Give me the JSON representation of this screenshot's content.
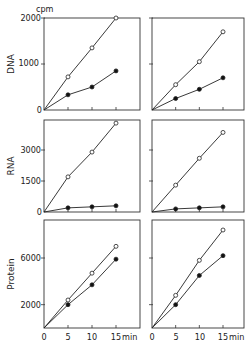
{
  "chart_data": {
    "type": "line",
    "layout": "3x2 panel grid",
    "unit_label": "cpm",
    "x": [
      0,
      5,
      10,
      15
    ],
    "xlabel": "min",
    "x_tick_labels": [
      "0",
      "5",
      "10",
      "15 min"
    ],
    "markers": {
      "open_circle": "series A (open circles)",
      "filled_circle": "series B (filled circles)"
    },
    "panels": [
      {
        "row": "DNA",
        "column": "left",
        "ylabel": "DNA",
        "yticks": [
          0,
          1000,
          2000
        ],
        "ylim": [
          0,
          2000
        ],
        "series": [
          {
            "name": "open",
            "values": [
              0,
              720,
              1350,
              2000
            ]
          },
          {
            "name": "filled",
            "values": [
              0,
              330,
              500,
              850
            ]
          }
        ]
      },
      {
        "row": "DNA",
        "column": "right",
        "ylabel": "",
        "yticks": [
          0,
          1000,
          2000
        ],
        "ylim": [
          0,
          2000
        ],
        "series": [
          {
            "name": "open",
            "values": [
              0,
              550,
              1050,
              1700
            ]
          },
          {
            "name": "filled",
            "values": [
              0,
              250,
              450,
              700
            ]
          }
        ]
      },
      {
        "row": "RNA",
        "column": "left",
        "ylabel": "RNA",
        "yticks": [
          0,
          1500,
          3000
        ],
        "ylim": [
          0,
          4500
        ],
        "series": [
          {
            "name": "open",
            "values": [
              0,
              1700,
              2900,
              4300
            ]
          },
          {
            "name": "filled",
            "values": [
              0,
              200,
              250,
              300
            ]
          }
        ]
      },
      {
        "row": "RNA",
        "column": "right",
        "ylabel": "",
        "yticks": [
          0,
          1500,
          3000
        ],
        "ylim": [
          0,
          4500
        ],
        "series": [
          {
            "name": "open",
            "values": [
              0,
              1300,
              2600,
              3850
            ]
          },
          {
            "name": "filled",
            "values": [
              0,
              150,
              200,
              250
            ]
          }
        ]
      },
      {
        "row": "Protein",
        "column": "left",
        "ylabel": "Protein",
        "yticks": [
          0,
          2000,
          6000
        ],
        "ylim": [
          0,
          9200
        ],
        "series": [
          {
            "name": "open",
            "values": [
              0,
              2400,
              4700,
              7000
            ]
          },
          {
            "name": "filled",
            "values": [
              0,
              2000,
              3700,
              5900
            ]
          }
        ]
      },
      {
        "row": "Protein",
        "column": "right",
        "ylabel": "",
        "yticks": [
          0,
          2000,
          6000
        ],
        "ylim": [
          0,
          9200
        ],
        "series": [
          {
            "name": "open",
            "values": [
              0,
              2800,
              5800,
              8400
            ]
          },
          {
            "name": "filled",
            "values": [
              0,
              2000,
              4500,
              6200
            ]
          }
        ]
      }
    ]
  },
  "labels": {
    "cpm": "cpm",
    "dna": "DNA",
    "rna": "RNA",
    "protein": "Protein",
    "dna_ticks": [
      "0",
      "1000",
      "2000"
    ],
    "rna_ticks": [
      "0",
      "1500",
      "3000"
    ],
    "protein_ticks": [
      "2000",
      "6000"
    ],
    "x_ticks": [
      "0",
      "5",
      "10",
      "15",
      "min"
    ]
  }
}
